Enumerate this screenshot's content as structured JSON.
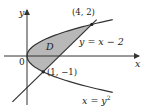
{
  "diagram": {
    "axes": {
      "x_label": "x",
      "y_label": "y",
      "origin_label": "0"
    },
    "region": {
      "label": "D",
      "fill": "#b8b8b8"
    },
    "curves": [
      {
        "id": "parabola",
        "equation": "x = y",
        "superscript": "2"
      },
      {
        "id": "line",
        "equation": "y = x − 2"
      }
    ],
    "points": [
      {
        "label": "(4, 2)",
        "x": 4,
        "y": 2
      },
      {
        "label": "(1, −1)",
        "x": 1,
        "y": -1
      }
    ],
    "stroke_color": "#333333"
  }
}
